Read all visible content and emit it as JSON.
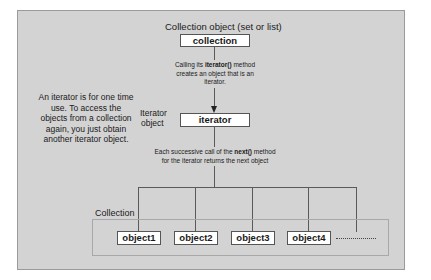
{
  "diagram": {
    "top_label": "Collection object (set or list)",
    "collection_box": "collection",
    "iterator_call_note": [
      "Calling its ",
      "iterator()",
      " method",
      "creates an object that is an",
      "iterator."
    ],
    "iterator_object_label": [
      "Iterator",
      "object"
    ],
    "iterator_box": "iterator",
    "next_note": [
      "Each successive call of the ",
      "next()",
      " method",
      "for the iterator returns the next object"
    ],
    "side_note": [
      "An iterator is for one time",
      "use. To access the",
      "objects from a collection",
      "again, you just obtain",
      "another iterator object."
    ],
    "collection_group_label": "Collection",
    "objects": [
      "object1",
      "object2",
      "object3",
      "object4"
    ],
    "continuation": "........"
  },
  "colors": {
    "panel_bg": "#d3d3d3",
    "box_bg": "#ffffff",
    "line": "#5a5a5a"
  }
}
